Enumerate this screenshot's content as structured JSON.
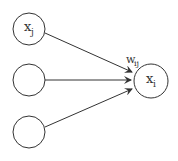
{
  "diagram": {
    "nodes": [
      {
        "id": "xj",
        "label": "x",
        "sub": "j"
      },
      {
        "id": "mid",
        "label": "",
        "sub": ""
      },
      {
        "id": "bottom",
        "label": "",
        "sub": ""
      },
      {
        "id": "xi",
        "label": "x",
        "sub": "i"
      }
    ],
    "edges": [
      {
        "from": "xj",
        "to": "xi",
        "label": "w",
        "sub": "ij"
      },
      {
        "from": "mid",
        "to": "xi"
      },
      {
        "from": "bottom",
        "to": "xi"
      }
    ],
    "colors": {
      "stroke": "#333333",
      "background": "#ffffff"
    }
  }
}
